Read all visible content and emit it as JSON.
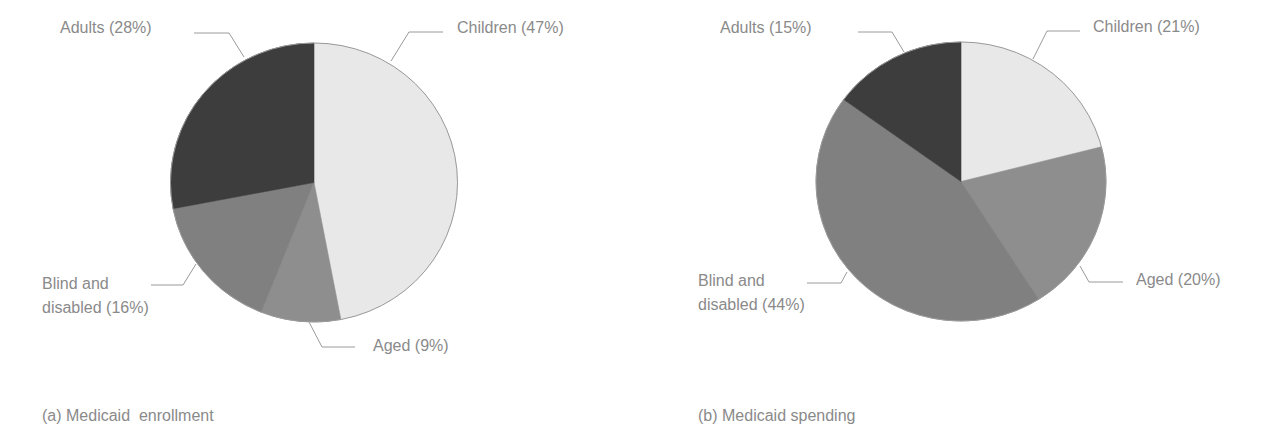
{
  "chart_data": [
    {
      "type": "pie",
      "title": "(a) Medicaid  enrollment",
      "start_angle_deg": 0,
      "direction": "clockwise",
      "categories": [
        "Children",
        "Aged",
        "Blind and disabled",
        "Adults"
      ],
      "values": [
        47,
        9,
        16,
        28
      ],
      "unit": "%",
      "colors": [
        "#e8e8e8",
        "#8e8e8e",
        "#808080",
        "#3d3d3d"
      ],
      "labels": [
        "Children (47%)",
        "Aged (9%)",
        "Blind and disabled (16%)",
        "Adults (28%)"
      ],
      "legend": "none (leader-line labels)"
    },
    {
      "type": "pie",
      "title": "(b) Medicaid spending",
      "start_angle_deg": 0,
      "direction": "clockwise",
      "categories": [
        "Children",
        "Aged",
        "Blind and disabled",
        "Adults"
      ],
      "values": [
        21,
        20,
        44,
        15
      ],
      "unit": "%",
      "colors": [
        "#e8e8e8",
        "#8e8e8e",
        "#808080",
        "#3d3d3d"
      ],
      "labels": [
        "Children (21%)",
        "Aged (20%)",
        "Blind and disabled (44%)",
        "Adults (15%)"
      ],
      "legend": "none (leader-line labels)"
    }
  ],
  "colors": {
    "text": "#8a8a8a",
    "leader_line": "#9a9a9a",
    "outline": "#9a9a9a"
  },
  "panels": {
    "a": {
      "caption": "(a) Medicaid  enrollment",
      "labels": {
        "adults": "Adults (28%)",
        "children": "Children (47%)",
        "blind_line1": "Blind and",
        "blind_line2": "disabled (16%)",
        "aged": "Aged (9%)"
      }
    },
    "b": {
      "caption": "(b) Medicaid spending",
      "labels": {
        "adults": "Adults (15%)",
        "children": "Children (21%)",
        "blind_line1": "Blind and",
        "blind_line2": "disabled (44%)",
        "aged": "Aged (20%)"
      }
    }
  }
}
